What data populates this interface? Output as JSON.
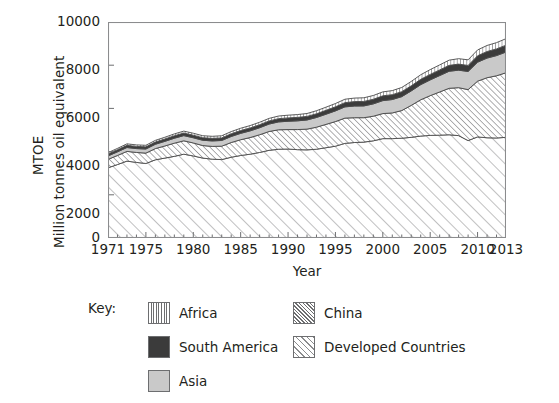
{
  "chart_data": {
    "type": "area",
    "stacked": true,
    "title": "",
    "xlabel": "Year",
    "ylabel": "MTOE\nMillion tonnes oil equivalent",
    "ylabel_lines": [
      "MTOE",
      "Million tonnes oil equivalent"
    ],
    "xlim": [
      1971,
      2013
    ],
    "ylim": [
      0,
      10000
    ],
    "yticks": [
      0,
      2000,
      4000,
      6000,
      8000,
      10000
    ],
    "xticks": [
      1971,
      1975,
      1980,
      1985,
      1990,
      1995,
      2000,
      2005,
      2010,
      2013
    ],
    "xtick_minor_step": 1,
    "grid": false,
    "legend_position": "below",
    "legend_title": "Key:",
    "x": [
      1971,
      1972,
      1973,
      1974,
      1975,
      1976,
      1977,
      1978,
      1979,
      1980,
      1981,
      1982,
      1983,
      1984,
      1985,
      1986,
      1987,
      1988,
      1989,
      1990,
      1991,
      1992,
      1993,
      1994,
      1995,
      1996,
      1997,
      1998,
      1999,
      2000,
      2001,
      2002,
      2003,
      2004,
      2005,
      2006,
      2007,
      2008,
      2009,
      2010,
      2011,
      2012,
      2013
    ],
    "stack_order_bottom_to_top": [
      "Developed Countries",
      "China",
      "Asia",
      "South America",
      "Africa"
    ],
    "series": [
      {
        "name": "Developed Countries",
        "fill": "#f2f2f2",
        "pattern": "diagonal-sparse",
        "values": [
          3250,
          3400,
          3560,
          3500,
          3450,
          3620,
          3700,
          3780,
          3880,
          3800,
          3700,
          3650,
          3630,
          3740,
          3820,
          3880,
          3960,
          4060,
          4110,
          4120,
          4090,
          4080,
          4110,
          4180,
          4250,
          4380,
          4420,
          4440,
          4500,
          4600,
          4600,
          4620,
          4660,
          4720,
          4750,
          4760,
          4780,
          4740,
          4510,
          4680,
          4640,
          4630,
          4660
        ]
      },
      {
        "name": "China",
        "fill": "#ffffff",
        "pattern": "diagonal-dense",
        "values": [
          390,
          420,
          450,
          460,
          480,
          520,
          560,
          610,
          620,
          600,
          580,
          590,
          620,
          680,
          730,
          770,
          820,
          870,
          900,
          900,
          930,
          960,
          1020,
          1080,
          1140,
          1170,
          1150,
          1130,
          1140,
          1160,
          1190,
          1280,
          1480,
          1680,
          1840,
          2000,
          2150,
          2220,
          2360,
          2580,
          2780,
          2880,
          2990
        ]
      },
      {
        "name": "Asia",
        "fill": "#c9c9c9",
        "pattern": "solid",
        "values": [
          160,
          170,
          180,
          180,
          190,
          200,
          215,
          230,
          240,
          240,
          245,
          255,
          265,
          280,
          295,
          310,
          325,
          345,
          365,
          385,
          405,
          425,
          450,
          470,
          495,
          520,
          540,
          545,
          570,
          600,
          620,
          645,
          670,
          700,
          730,
          760,
          790,
          810,
          840,
          880,
          910,
          935,
          960
        ]
      },
      {
        "name": "South America",
        "fill": "#3b3b3b",
        "pattern": "solid",
        "values": [
          90,
          95,
          100,
          100,
          100,
          105,
          110,
          115,
          120,
          120,
          118,
          118,
          120,
          125,
          130,
          135,
          140,
          145,
          150,
          155,
          160,
          165,
          172,
          180,
          188,
          196,
          204,
          208,
          214,
          222,
          226,
          230,
          236,
          246,
          254,
          262,
          272,
          280,
          280,
          296,
          304,
          310,
          318
        ]
      },
      {
        "name": "Africa",
        "fill": "#ffffff",
        "pattern": "vertical",
        "values": [
          60,
          64,
          68,
          70,
          72,
          76,
          80,
          84,
          88,
          90,
          92,
          95,
          98,
          102,
          106,
          110,
          114,
          118,
          122,
          126,
          130,
          134,
          140,
          146,
          152,
          158,
          164,
          168,
          174,
          182,
          188,
          194,
          202,
          212,
          222,
          232,
          242,
          252,
          258,
          270,
          280,
          290,
          300
        ]
      }
    ]
  },
  "axes": {
    "y_tick_labels": [
      "10000",
      "8000",
      "6000",
      "4000",
      "2000",
      "0"
    ],
    "x_tick_labels": [
      "1971",
      "1975",
      "1980",
      "1985",
      "1990",
      "1995",
      "2000",
      "2005",
      "2010",
      "2013"
    ],
    "x_axis_title": "Year",
    "y_axis_title_line1": "MTOE",
    "y_axis_title_line2": "Million tonnes oil equivalent"
  },
  "legend": {
    "title": "Key:",
    "column1": [
      {
        "label": "Africa",
        "swatch": "vertical-hatch-swatch"
      },
      {
        "label": "South America",
        "swatch": "solid-dark-swatch"
      },
      {
        "label": "Asia",
        "swatch": "solid-gray-swatch"
      }
    ],
    "column2": [
      {
        "label": "China",
        "swatch": "dense-diagonal-hatch-swatch"
      },
      {
        "label": "Developed Countries",
        "swatch": "sparse-diagonal-hatch-swatch"
      }
    ]
  },
  "colors": {
    "axis": "#6d6e70",
    "text": "#231f20",
    "south_america": "#3b3b3b",
    "asia": "#c9c9c9",
    "hatch_line": "#6d6e70",
    "developed_fill": "#f4f4f4"
  }
}
